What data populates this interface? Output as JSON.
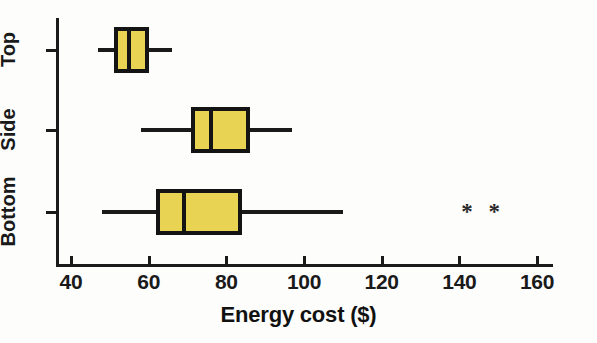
{
  "chart_data": {
    "type": "box",
    "title": "",
    "xlabel": "Energy cost ($)",
    "ylabel": "",
    "orientation": "horizontal",
    "xlim": [
      36,
      167
    ],
    "grid": false,
    "legend": null,
    "x_ticks": [
      40,
      60,
      80,
      100,
      120,
      140,
      160
    ],
    "x_tick_labels": [
      "40",
      "60",
      "80",
      "100",
      "120",
      "140",
      "160"
    ],
    "categories": [
      "Top",
      "Side",
      "Bottom"
    ],
    "boxes": [
      {
        "category": "Top",
        "whisker_low": 47,
        "q1": 51,
        "median": 55,
        "q3": 60,
        "whisker_high": 66,
        "outliers": []
      },
      {
        "category": "Side",
        "whisker_low": 58,
        "q1": 71,
        "median": 76,
        "q3": 86,
        "whisker_high": 97,
        "outliers": []
      },
      {
        "category": "Bottom",
        "whisker_low": 48,
        "q1": 62,
        "median": 69,
        "q3": 84,
        "whisker_high": 110,
        "outliers": [
          142,
          149
        ]
      }
    ],
    "outlier_symbol": "*",
    "colors": {
      "box_fill": "#e9d352",
      "box_edge": "#141414",
      "axis": "#1a1a1a",
      "text": "#111111",
      "background": "#fdfdfc"
    }
  }
}
